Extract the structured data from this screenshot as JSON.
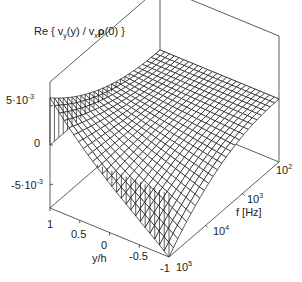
{
  "chart_data": {
    "type": "surface3d",
    "zlabel": "Re { vy(y) / vxρ(0) }",
    "xlabel": "y/h",
    "ylabel": "f [Hz]",
    "z_ticks": [
      "5·10⁻³",
      "0",
      "-5·10⁻³"
    ],
    "z_tick_values": [
      0.005,
      0,
      -0.005
    ],
    "x_ticks": [
      "1",
      "0.5",
      "0",
      "-0.5",
      "-1"
    ],
    "x_tick_values": [
      1,
      0.5,
      0,
      -0.5,
      -1
    ],
    "y_ticks": [
      "10²",
      "10³",
      "10⁴",
      "10⁵"
    ],
    "y_tick_values": [
      100,
      1000,
      10000,
      100000
    ],
    "y_scale": "log",
    "xlim": [
      -1,
      1
    ],
    "ylim": [
      100,
      100000
    ],
    "zlim": [
      -0.008,
      0.008
    ],
    "grid_resolution": [
      25,
      25
    ],
    "samples": [
      {
        "f": 100,
        "y": 1,
        "z": 0.0
      },
      {
        "f": 100,
        "y": -1,
        "z": 0.0
      },
      {
        "f": 100000,
        "y": 1,
        "z": 0.006
      },
      {
        "f": 100000,
        "y": 0.5,
        "z": 0.001
      },
      {
        "f": 100000,
        "y": 0,
        "z": -0.002
      },
      {
        "f": 100000,
        "y": -0.5,
        "z": -0.005
      },
      {
        "f": 100000,
        "y": -1,
        "z": -0.008
      }
    ]
  },
  "labels": {
    "title_prefix": "Re { v",
    "title_sub1": "y",
    "title_mid": "(y) / v",
    "title_sub2": "x",
    "title_rho": "ρ",
    "title_suffix": "(0) }",
    "z_tick_pos": "5·10",
    "z_tick_pos_exp": "-3",
    "z_tick_zero": "0",
    "z_tick_neg": "-5·10",
    "z_tick_neg_exp": "-3",
    "y_tick_1": "1",
    "y_tick_05": "0.5",
    "y_tick_0": "0",
    "y_tick_m05": "-0.5",
    "y_tick_m1": "-1",
    "y_axis_label": "y/h",
    "f_tick_base": "10",
    "f_tick_2": "2",
    "f_tick_3": "3",
    "f_tick_4": "4",
    "f_tick_5": "5",
    "f_axis_label": "f [Hz]"
  },
  "colors": {
    "line": "#1a1a1a",
    "box": "#333333",
    "background": "#ffffff"
  }
}
